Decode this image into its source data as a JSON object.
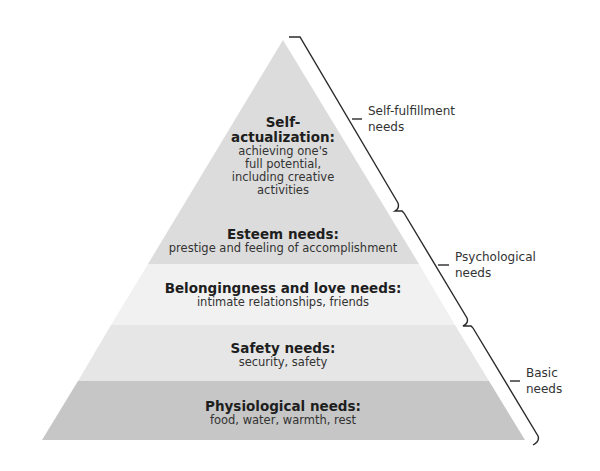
{
  "diagram": {
    "type": "pyramid",
    "tiers": [
      {
        "id": "self-actualization",
        "title_line1": "Self-",
        "title_line2": "actualization:",
        "desc_lines": [
          "achieving one's",
          "full potential,",
          "including creative",
          "activities"
        ],
        "fill": "#dcdcdc"
      },
      {
        "id": "esteem",
        "title": "Esteem needs:",
        "desc": "prestige and feeling of accomplishment",
        "fill": "#dcdcdc"
      },
      {
        "id": "belongingness",
        "title": "Belongingness and love needs:",
        "desc": "intimate relationships, friends",
        "fill": "#f1f1f1"
      },
      {
        "id": "safety",
        "title": "Safety needs:",
        "desc": "security, safety",
        "fill": "#e6e6e6"
      },
      {
        "id": "physiological",
        "title": "Physiological needs:",
        "desc": "food, water, warmth, rest",
        "fill": "#c6c6c6"
      }
    ],
    "groups": [
      {
        "id": "self-fulfillment",
        "line1": "Self-fulfillment",
        "line2": "needs",
        "covers": [
          "self-actualization"
        ]
      },
      {
        "id": "psychological",
        "line1": "Psychological",
        "line2": "needs",
        "covers": [
          "esteem",
          "belongingness"
        ]
      },
      {
        "id": "basic",
        "line1": "Basic",
        "line2": "needs",
        "covers": [
          "safety",
          "physiological"
        ]
      }
    ],
    "bracket_color": "#2a2a2a"
  }
}
